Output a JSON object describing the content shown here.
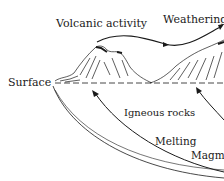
{
  "diagram": {
    "labels": {
      "volcanic_activity": "Volcanic activity",
      "weathering": "Weathering",
      "surface": "Surface",
      "igneous_rocks": "Igneous rocks",
      "melting": "Melting",
      "magma": "Magma"
    },
    "colors": {
      "ink": "#1a1a1a",
      "background": "#ffffff"
    }
  }
}
